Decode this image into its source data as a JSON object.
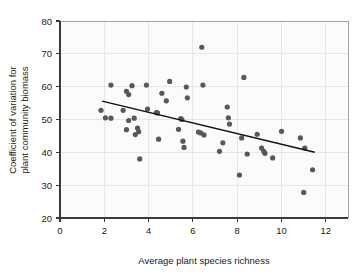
{
  "chart_data": {
    "type": "scatter",
    "title": "",
    "xlabel": "Average plant species richness",
    "ylabel_line1": "Coefficient of variation for",
    "ylabel_line2": "plant community biomass",
    "xlim": [
      0,
      13
    ],
    "ylim": [
      20,
      80
    ],
    "xticks": [
      0,
      2,
      4,
      6,
      8,
      10,
      12
    ],
    "yticks": [
      20,
      30,
      40,
      50,
      60,
      70,
      80
    ],
    "xtick_labels": [
      "0",
      "2",
      "4",
      "6",
      "8",
      "10",
      "12"
    ],
    "ytick_labels": [
      "20",
      "30",
      "40",
      "50",
      "60",
      "70",
      "80"
    ],
    "grid": true,
    "legend": "none",
    "point_color": "#58585a",
    "point_radius": 2.6,
    "line_color": "#111111",
    "grid_color": "#e2e2e2",
    "axis_color": "#3a3a3a",
    "background_color": "#ffffff",
    "plot_background_color": "#fbfbfb",
    "points": [
      [
        1.85,
        52.8
      ],
      [
        2.05,
        50.5
      ],
      [
        2.3,
        60.5
      ],
      [
        2.3,
        50.4
      ],
      [
        2.85,
        52.8
      ],
      [
        3.0,
        58.6
      ],
      [
        3.1,
        57.6
      ],
      [
        3.25,
        60.3
      ],
      [
        3.1,
        49.7
      ],
      [
        3.0,
        46.9
      ],
      [
        3.35,
        50.4
      ],
      [
        3.4,
        45.4
      ],
      [
        3.5,
        47.4
      ],
      [
        3.55,
        46.3
      ],
      [
        3.6,
        38.0
      ],
      [
        3.9,
        60.5
      ],
      [
        3.95,
        53.2
      ],
      [
        4.35,
        52.1
      ],
      [
        4.4,
        52.0
      ],
      [
        4.45,
        44.0
      ],
      [
        4.6,
        58.0
      ],
      [
        4.8,
        55.7
      ],
      [
        4.95,
        61.6
      ],
      [
        5.35,
        47.0
      ],
      [
        5.45,
        50.3
      ],
      [
        5.5,
        50.0
      ],
      [
        5.55,
        43.4
      ],
      [
        5.6,
        41.5
      ],
      [
        5.7,
        59.9
      ],
      [
        5.75,
        56.6
      ],
      [
        6.25,
        46.2
      ],
      [
        6.35,
        45.9
      ],
      [
        6.4,
        72.0
      ],
      [
        6.45,
        60.5
      ],
      [
        6.5,
        45.3
      ],
      [
        7.2,
        40.3
      ],
      [
        7.35,
        42.9
      ],
      [
        7.55,
        53.8
      ],
      [
        7.6,
        50.5
      ],
      [
        7.65,
        48.6
      ],
      [
        8.1,
        33.1
      ],
      [
        8.2,
        44.4
      ],
      [
        8.3,
        62.8
      ],
      [
        8.45,
        39.5
      ],
      [
        8.9,
        45.5
      ],
      [
        9.1,
        41.3
      ],
      [
        9.2,
        40.3
      ],
      [
        9.25,
        39.7
      ],
      [
        9.6,
        38.3
      ],
      [
        10.0,
        46.4
      ],
      [
        10.85,
        44.4
      ],
      [
        11.0,
        27.8
      ],
      [
        11.05,
        41.3
      ],
      [
        11.4,
        34.7
      ]
    ],
    "trendline": {
      "x1": 1.9,
      "y1": 55.6,
      "x2": 11.5,
      "y2": 40.0
    }
  }
}
